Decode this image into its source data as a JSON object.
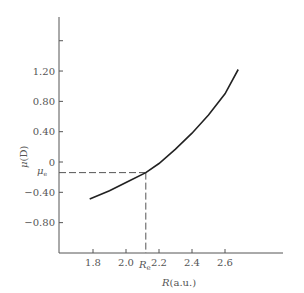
{
  "chart_data": {
    "type": "line",
    "title": "",
    "xlabel": "R(a.u.)",
    "ylabel": "μ(D)",
    "xlim": [
      1.6,
      2.95
    ],
    "ylim": [
      -1.1,
      1.9
    ],
    "x_ticks": [
      {
        "value": 1.8,
        "label": "1.8"
      },
      {
        "value": 2.0,
        "label": "2.0"
      },
      {
        "value": 2.2,
        "label": "2.2"
      },
      {
        "value": 2.4,
        "label": "2.4"
      },
      {
        "value": 2.6,
        "label": "2.6"
      }
    ],
    "y_ticks": [
      {
        "value": 1.6,
        "label": ""
      },
      {
        "value": 1.2,
        "label": "1.20"
      },
      {
        "value": 0.8,
        "label": "0.80"
      },
      {
        "value": 0.4,
        "label": "0.40"
      },
      {
        "value": 0,
        "label": "0"
      },
      {
        "value": -0.4,
        "label": "−0.40"
      },
      {
        "value": -0.8,
        "label": "−0.80"
      }
    ],
    "series": [
      {
        "name": "dipole moment",
        "x": [
          1.78,
          1.9,
          2.0,
          2.12,
          2.2,
          2.3,
          2.4,
          2.5,
          2.6,
          2.68
        ],
        "y": [
          -0.49,
          -0.38,
          -0.27,
          -0.14,
          -0.02,
          0.17,
          0.38,
          0.62,
          0.9,
          1.22
        ]
      }
    ],
    "annotations": [
      {
        "type": "point",
        "x": 2.12,
        "y": -0.14,
        "x_label": "Rₑ",
        "y_label": "μₑ",
        "dashed_guides": true
      }
    ],
    "grid": false,
    "legend": null
  },
  "labels": {
    "xlabel_main": "R",
    "xlabel_unit": "(a.u.)",
    "ylabel_main": "μ",
    "ylabel_unit": "(D)",
    "re_main": "R",
    "re_sub": "e",
    "mue_main": "μ",
    "mue_sub": "e"
  }
}
